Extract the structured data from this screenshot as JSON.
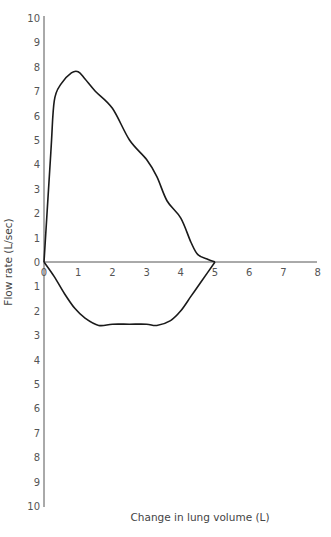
{
  "chart_data": {
    "type": "line",
    "title": "",
    "xlabel": "Change in lung volume (L)",
    "ylabel": "Flow rate (L/sec)",
    "xlim": [
      0,
      8
    ],
    "ylim": [
      -10,
      10
    ],
    "x_ticks": [
      "0",
      "1",
      "2",
      "3",
      "4",
      "5",
      "6",
      "7",
      "8"
    ],
    "y_ticks_upper": [
      "10",
      "9",
      "8",
      "7",
      "6",
      "5",
      "4",
      "3",
      "2",
      "1",
      "0"
    ],
    "y_ticks_lower": [
      "0",
      "1",
      "2",
      "3",
      "4",
      "5",
      "6",
      "7",
      "8",
      "9",
      "10"
    ],
    "grid": false,
    "legend": null,
    "series": [
      {
        "name": "Expiration (flow-volume loop, upper limb)",
        "x": [
          0,
          0.2,
          0.3,
          0.5,
          0.8,
          1.0,
          1.2,
          1.5,
          2.0,
          2.5,
          3.0,
          3.3,
          3.6,
          4.0,
          4.3,
          4.5,
          4.8,
          5.0
        ],
        "y": [
          0,
          4.5,
          6.6,
          7.3,
          7.75,
          7.8,
          7.5,
          7.0,
          6.3,
          5.0,
          4.2,
          3.5,
          2.5,
          1.8,
          0.8,
          0.3,
          0.1,
          0
        ]
      },
      {
        "name": "Inspiration (flow-volume loop, lower limb)",
        "x": [
          0,
          0.3,
          0.6,
          0.9,
          1.2,
          1.6,
          2.0,
          2.5,
          3.0,
          3.3,
          3.7,
          4.0,
          4.3,
          4.6,
          5.0
        ],
        "y": [
          0,
          -0.6,
          -1.3,
          -1.9,
          -2.3,
          -2.6,
          -2.55,
          -2.55,
          -2.55,
          -2.6,
          -2.4,
          -2.0,
          -1.4,
          -0.8,
          0
        ]
      }
    ]
  },
  "colors": {
    "curve": "#1a1a1a",
    "axis": "#555555",
    "text": "#555555"
  }
}
